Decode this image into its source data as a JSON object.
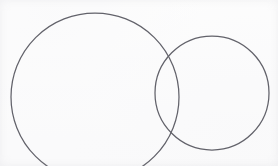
{
  "figure": {
    "kind": "two-overlapping-circles",
    "description": "Line drawing of two overlapping circle outlines forming a lens-shaped intersection",
    "canvas": {
      "width": 278,
      "height": 166,
      "background_color": "#fdfdfd"
    },
    "stroke": {
      "color": "#63636b",
      "width": 1.25,
      "fill": "none",
      "linecap": "round"
    },
    "shapes": [
      {
        "name": "large-left-circle",
        "label": "Large left circle",
        "center_x": 95,
        "center_y": 97,
        "radius": 84,
        "bounds": {
          "left": 11,
          "top": 13,
          "right": 179,
          "bottom": 181
        },
        "clipped_at_bottom": true
      },
      {
        "name": "small-right-circle",
        "label": "Small right circle",
        "center_x": 212,
        "center_y": 93,
        "radius": 57,
        "bounds": {
          "left": 155,
          "top": 36,
          "right": 269,
          "bottom": 150
        },
        "clipped_at_bottom": false
      }
    ],
    "intersections": [
      {
        "name": "upper-intersection-point",
        "x": 167,
        "y": 53
      },
      {
        "name": "lower-intersection-point",
        "x": 168,
        "y": 132
      }
    ]
  }
}
